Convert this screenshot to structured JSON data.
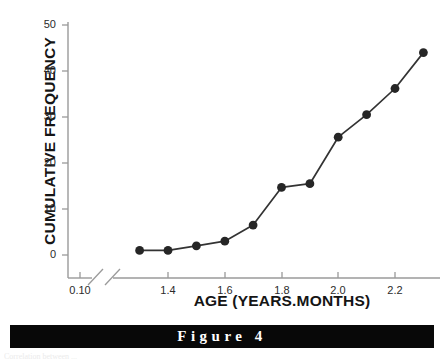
{
  "figure": {
    "banner_label": "Figure 4",
    "footer_sliver": "Correlation between ..."
  },
  "chart_data": {
    "type": "line",
    "title": "",
    "subtitle": "",
    "xlabel": "AGE (YEARS.MONTHS)",
    "ylabel": "CUMULATIVE FREQUENCY",
    "x": [
      1.3,
      1.4,
      1.5,
      1.6,
      1.7,
      1.8,
      1.9,
      2.0,
      2.1,
      2.2,
      2.3
    ],
    "values": [
      1,
      1,
      2,
      3,
      6.5,
      14.7,
      15.5,
      25.6,
      30.5,
      36.2,
      44
    ],
    "xlim": [
      1.25,
      2.32
    ],
    "ylim": [
      0,
      50
    ],
    "xticks": [
      "0.10",
      "1.4",
      "1.6",
      "1.8",
      "2.0",
      "2.2"
    ],
    "xtick_values": [
      0.1,
      1.4,
      1.6,
      1.8,
      2.0,
      2.2
    ],
    "yticks": [
      "0",
      "10",
      "20",
      "30",
      "40",
      "50"
    ],
    "ytick_values": [
      0,
      10,
      20,
      30,
      40,
      50
    ],
    "axis_break": true,
    "axis_break_note": "broken x-axis between 0.10 and 1.3",
    "grid": false,
    "legend": "none",
    "marker": "filled-circle",
    "marker_size": 6,
    "colors": {
      "line": "#333333",
      "marker": "#262626",
      "axis": "#9a9a9a",
      "text": "#151515",
      "banner_background": "#080808",
      "banner_text": "#ffffff"
    }
  }
}
